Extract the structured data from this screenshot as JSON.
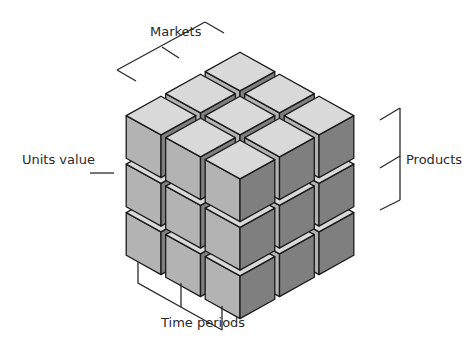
{
  "labels": {
    "markets": "Markets",
    "units_value": "Units value",
    "products": "Products",
    "time_periods": "Time periods"
  },
  "cube": {
    "rows": 3,
    "cols": 3,
    "layers": 3
  },
  "colors": {
    "top_face": "#d9d9d9",
    "left_face": "#b3b3b3",
    "right_face": "#7f7f7f",
    "edge": "#1a1a1a",
    "bracket": "#2a2a2a"
  }
}
